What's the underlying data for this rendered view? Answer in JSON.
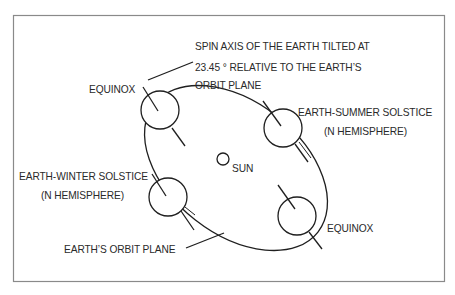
{
  "diagram": {
    "frame": {
      "x": 13,
      "y": 15,
      "width": 432,
      "height": 267,
      "color": "#8a8a8a"
    },
    "colors": {
      "line": "#1f1f1f",
      "text": "#2a2a2a",
      "background": "#ffffff"
    },
    "labels": {
      "spin_axis_line1": "SPIN AXIS OF THE EARTH TILTED AT",
      "spin_axis_line2": "23.45 ° RELATIVE TO THE EARTH’S",
      "spin_axis_line3": "ORBIT PLANE",
      "equinox_top": "EQUINOX",
      "summer_line1": "EARTH-SUMMER SOLSTICE",
      "summer_line2": "(N HEMISPHERE)",
      "winter_line1": "EARTH-WINTER SOLSTICE",
      "winter_line2": "(N HEMISPHERE)",
      "sun": "SUN",
      "equinox_bottom": "EQUINOX",
      "orbit_plane": "EARTH’S ORBIT PLANE"
    },
    "nodes": [
      {
        "id": "equinox-top",
        "cx": 160,
        "cy": 110,
        "r": 19
      },
      {
        "id": "summer-solstice",
        "cx": 283,
        "cy": 128,
        "r": 19
      },
      {
        "id": "winter-solstice",
        "cx": 168,
        "cy": 197,
        "r": 19
      },
      {
        "id": "equinox-bottom",
        "cx": 297,
        "cy": 216,
        "r": 19
      },
      {
        "id": "sun",
        "cx": 223,
        "cy": 159,
        "r": 6
      }
    ],
    "tilt_degrees": "23.45"
  }
}
